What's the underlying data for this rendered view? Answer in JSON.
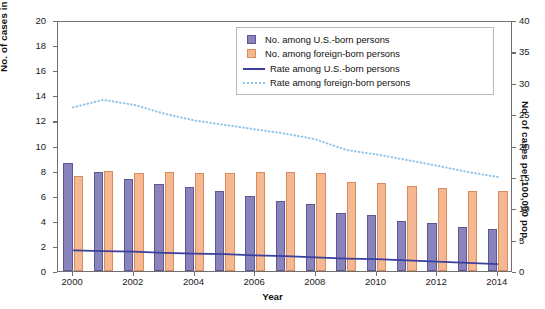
{
  "chart_data": {
    "type": "bar",
    "title": "",
    "xlabel": "Year",
    "ylabel": "No. of cases in thousands",
    "y2label": "No. of cases per 100,000 pop.",
    "categories": [
      2000,
      2001,
      2002,
      2003,
      2004,
      2005,
      2006,
      2007,
      2008,
      2009,
      2010,
      2011,
      2012,
      2013,
      2014
    ],
    "xticks": [
      2000,
      2002,
      2004,
      2006,
      2008,
      2010,
      2012,
      2014
    ],
    "yticks": [
      0,
      2,
      4,
      6,
      8,
      10,
      12,
      14,
      16,
      18,
      20
    ],
    "y2ticks": [
      0,
      5,
      10,
      15,
      20,
      25,
      30,
      35,
      40
    ],
    "ylim": [
      0,
      20
    ],
    "y2lim": [
      0,
      40
    ],
    "grid": false,
    "legend_position": "top-right",
    "series": [
      {
        "name": "No. among U.S.-born persons",
        "type": "bar",
        "axis": "left",
        "color": "#8a84bd",
        "edge": "#5d5796",
        "values": [
          8.6,
          7.9,
          7.3,
          6.9,
          6.7,
          6.4,
          5.95,
          5.6,
          5.35,
          4.65,
          4.45,
          4.0,
          3.85,
          3.5,
          3.35
        ]
      },
      {
        "name": "No. among foreign-born persons",
        "type": "bar",
        "axis": "left",
        "color": "#f4b993",
        "edge": "#d98b5e",
        "values": [
          7.6,
          8.0,
          7.8,
          7.9,
          7.8,
          7.8,
          7.9,
          7.85,
          7.8,
          7.1,
          7.0,
          6.8,
          6.6,
          6.4,
          6.4
        ]
      },
      {
        "name": "Rate among U.S.-born persons",
        "type": "line",
        "axis": "right",
        "style": "solid",
        "color": "#3b3f9e",
        "values": [
          3.6,
          3.5,
          3.4,
          3.2,
          3.1,
          3.0,
          2.8,
          2.7,
          2.5,
          2.3,
          2.2,
          2.0,
          1.8,
          1.6,
          1.4
        ]
      },
      {
        "name": "Rate among foreign-born persons",
        "type": "line",
        "axis": "right",
        "style": "dotted",
        "color": "#8fc4e8",
        "values": [
          26.4,
          27.6,
          26.8,
          25.4,
          24.3,
          23.6,
          22.9,
          22.2,
          21.3,
          19.6,
          18.9,
          18.0,
          17.1,
          16.1,
          15.3
        ]
      }
    ]
  },
  "axes": {
    "y_left_label": "No. of cases in thousands",
    "y_right_label": "No. of cases per 100,000 pop.",
    "x_label": "Year"
  },
  "legend": {
    "items": [
      {
        "label": "No. among U.S.-born persons",
        "marker": "swatch-purple"
      },
      {
        "label": "No. among foreign-born persons",
        "marker": "swatch-orange"
      },
      {
        "label": "Rate among U.S.-born persons",
        "marker": "line-solid-blue"
      },
      {
        "label": "Rate among foreign-born persons",
        "marker": "line-dotted-lightblue"
      }
    ]
  }
}
